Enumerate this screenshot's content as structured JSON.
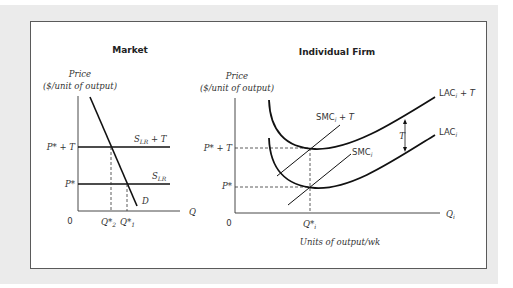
{
  "figure": {
    "panels": [
      {
        "title": "Market",
        "y_axis_label_line1": "Price",
        "y_axis_label_line2": "($/unit of output)",
        "x_axis_label": "Q",
        "origin_label": "0",
        "price_levels": [
          {
            "label": "P* + T",
            "line_label_main": "S",
            "line_label_sub": "LR",
            "line_label_suffix": " + T"
          },
          {
            "label": "P*",
            "line_label_main": "S",
            "line_label_sub": "LR",
            "line_label_suffix": ""
          }
        ],
        "demand_label": "D",
        "quantity_labels": [
          {
            "main": "Q*",
            "sub": "2"
          },
          {
            "main": "Q*",
            "sub": "1"
          }
        ]
      },
      {
        "title": "Individual Firm",
        "y_axis_label_line1": "Price",
        "y_axis_label_line2": "($/unit of output)",
        "x_axis_label_main": "Q",
        "x_axis_label_sub": "i",
        "x_axis_caption": "Units of output/wk",
        "origin_label": "0",
        "price_levels": [
          {
            "label": "P* + T"
          },
          {
            "label": "P*"
          }
        ],
        "quantity_label": {
          "main": "Q*",
          "sub": "i"
        },
        "curves": {
          "lac_plus_t": {
            "main": "LAC",
            "sub": "i",
            "suffix": " + T"
          },
          "lac": {
            "main": "LAC",
            "sub": "i",
            "suffix": ""
          },
          "smc_plus_t": {
            "main": "SMC",
            "sub": "i",
            "suffix": " + T"
          },
          "smc": {
            "main": "SMC",
            "sub": "i",
            "suffix": ""
          }
        },
        "tax_gap_label": "T"
      }
    ]
  },
  "colors": {
    "background": "#ebebeb",
    "frame_border": "#5a5a5a",
    "curve": "#111111",
    "axis": "#333333"
  }
}
